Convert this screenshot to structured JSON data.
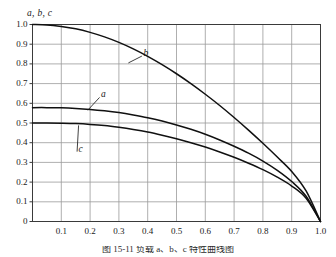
{
  "figure": {
    "background_color": "#ffffff",
    "axis_color": "#3a3a3a",
    "grid_color": "#9a9a9a",
    "curve_color": "#101010",
    "caption": "图 15-11   负载 a、b、c 特性曲线图"
  },
  "chart_data": {
    "type": "line",
    "title": "",
    "subtitle": "",
    "xlabel": "",
    "ylabel": "a, b, c",
    "ylabel_text": "a, b, c",
    "xlim": [
      0,
      1.0
    ],
    "ylim": [
      0,
      1.0
    ],
    "grid": true,
    "legend": "inline-curve-labels",
    "xticks": [
      0.1,
      0.2,
      0.3,
      0.4,
      0.5,
      0.6,
      0.7,
      0.8,
      0.9,
      1.0
    ],
    "xticklabels": [
      "0.1",
      "0.2",
      "0.3",
      "0.4",
      "0.5",
      "0.6",
      "0.7",
      "0.8",
      "0.9",
      "1.0"
    ],
    "yticks": [
      0,
      0.1,
      0.2,
      0.3,
      0.4,
      0.5,
      0.6,
      0.7,
      0.8,
      0.9,
      1.0
    ],
    "yticklabels": [
      "0",
      "0.1",
      "0.2",
      "0.3",
      "0.4",
      "0.5",
      "0.6",
      "0.7",
      "0.8",
      "0.9",
      "1.0"
    ],
    "x": [
      0,
      0.05,
      0.1,
      0.15,
      0.2,
      0.25,
      0.3,
      0.35,
      0.4,
      0.45,
      0.5,
      0.55,
      0.6,
      0.65,
      0.7,
      0.75,
      0.8,
      0.85,
      0.9,
      0.95,
      1.0
    ],
    "series": [
      {
        "name": "b",
        "label": "b",
        "label_x": 0.385,
        "label_y": 0.855,
        "leader_to_x": 0.333,
        "leader_to_y": 0.805,
        "values": [
          1.0,
          0.998,
          0.99,
          0.978,
          0.96,
          0.937,
          0.909,
          0.876,
          0.838,
          0.796,
          0.75,
          0.7,
          0.646,
          0.589,
          0.528,
          0.464,
          0.397,
          0.327,
          0.254,
          0.155,
          0.0
        ]
      },
      {
        "name": "a",
        "label": "a",
        "label_x": 0.238,
        "label_y": 0.645,
        "leader_to_x": 0.192,
        "leader_to_y": 0.565,
        "values": [
          0.578,
          0.578,
          0.577,
          0.574,
          0.569,
          0.562,
          0.553,
          0.541,
          0.527,
          0.51,
          0.49,
          0.468,
          0.443,
          0.414,
          0.382,
          0.347,
          0.307,
          0.26,
          0.203,
          0.128,
          0.0
        ]
      },
      {
        "name": "c",
        "label": "c",
        "label_x": 0.16,
        "label_y": 0.37,
        "leader_to_x": 0.16,
        "leader_to_y": 0.488,
        "values": [
          0.5,
          0.5,
          0.499,
          0.497,
          0.493,
          0.487,
          0.478,
          0.467,
          0.454,
          0.438,
          0.42,
          0.4,
          0.378,
          0.353,
          0.326,
          0.296,
          0.263,
          0.225,
          0.18,
          0.118,
          0.0
        ]
      }
    ]
  }
}
